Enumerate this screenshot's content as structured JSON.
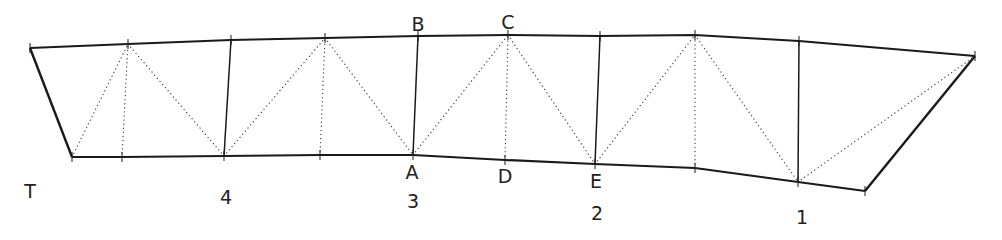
{
  "diagram": {
    "type": "truss",
    "style": {
      "stroke": "#1a1a1a",
      "dotted_stroke": "#444444",
      "background": "#ffffff"
    },
    "top_chord": [
      [
        30,
        48
      ],
      [
        128,
        44
      ],
      [
        231,
        40
      ],
      [
        325,
        38
      ],
      [
        418,
        36
      ],
      [
        508,
        35
      ],
      [
        600,
        36
      ],
      [
        695,
        35
      ],
      [
        799,
        41
      ],
      [
        975,
        56
      ]
    ],
    "bottom_chord": [
      [
        72,
        157
      ],
      [
        122,
        157
      ],
      [
        224,
        156
      ],
      [
        320,
        155
      ],
      [
        413,
        155
      ],
      [
        505,
        160
      ],
      [
        595,
        164
      ],
      [
        695,
        168
      ],
      [
        798,
        182
      ],
      [
        865,
        191
      ]
    ],
    "end_posts": [
      [
        [
          30,
          48
        ],
        [
          72,
          157
        ]
      ],
      [
        [
          975,
          56
        ],
        [
          865,
          191
        ]
      ]
    ],
    "solid_verticals": [
      [
        [
          231,
          40
        ],
        [
          224,
          156
        ]
      ],
      [
        [
          418,
          36
        ],
        [
          413,
          155
        ]
      ],
      [
        [
          600,
          36
        ],
        [
          595,
          164
        ]
      ],
      [
        [
          799,
          41
        ],
        [
          798,
          182
        ]
      ]
    ],
    "dotted_members": [
      [
        [
          72,
          157
        ],
        [
          128,
          44
        ]
      ],
      [
        [
          122,
          157
        ],
        [
          128,
          44
        ]
      ],
      [
        [
          128,
          44
        ],
        [
          224,
          156
        ]
      ],
      [
        [
          224,
          156
        ],
        [
          325,
          38
        ]
      ],
      [
        [
          320,
          155
        ],
        [
          325,
          38
        ]
      ],
      [
        [
          325,
          38
        ],
        [
          413,
          155
        ]
      ],
      [
        [
          413,
          155
        ],
        [
          508,
          35
        ]
      ],
      [
        [
          505,
          160
        ],
        [
          508,
          35
        ]
      ],
      [
        [
          508,
          35
        ],
        [
          595,
          164
        ]
      ],
      [
        [
          595,
          164
        ],
        [
          695,
          35
        ]
      ],
      [
        [
          695,
          168
        ],
        [
          695,
          35
        ]
      ],
      [
        [
          695,
          35
        ],
        [
          798,
          182
        ]
      ],
      [
        [
          798,
          182
        ],
        [
          975,
          56
        ]
      ]
    ],
    "node_labels": [
      {
        "text": "B",
        "x": 418,
        "y": 24
      },
      {
        "text": "C",
        "x": 508,
        "y": 22
      },
      {
        "text": "A",
        "x": 412,
        "y": 172
      },
      {
        "text": "D",
        "x": 505,
        "y": 176
      },
      {
        "text": "E",
        "x": 596,
        "y": 181
      }
    ],
    "panel_labels": [
      {
        "text": "T",
        "x": 30,
        "y": 191
      },
      {
        "text": "4",
        "x": 226,
        "y": 197
      },
      {
        "text": "3",
        "x": 413,
        "y": 201
      },
      {
        "text": "2",
        "x": 597,
        "y": 213
      },
      {
        "text": "1",
        "x": 802,
        "y": 217
      }
    ]
  }
}
